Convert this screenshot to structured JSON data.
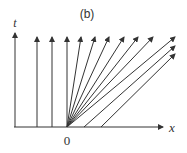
{
  "diagram": {
    "title": "(b)",
    "axes": {
      "x_label": "x",
      "t_label": "t",
      "origin_label": "0"
    },
    "line_color": "#333333",
    "groups": {
      "vertical_lines_left_of_origin": 3,
      "fan_lines_from_origin": 8,
      "parallel_lines_right_of_origin": 2
    }
  }
}
